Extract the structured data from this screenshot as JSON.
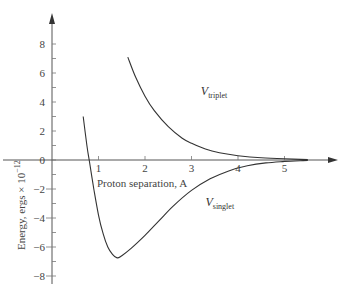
{
  "chart_data": {
    "type": "line",
    "title": "",
    "xlabel": "Proton separation, A",
    "ylabel": "Energy, ergs × 10^-12",
    "ylabel_parts": {
      "main": "Energy, ergs × 10",
      "exp": "−12"
    },
    "xlim": [
      0,
      6
    ],
    "ylim": [
      -8.5,
      9.5
    ],
    "x_ticks": [
      1,
      2,
      3,
      4,
      5
    ],
    "y_ticks": [
      8,
      6,
      4,
      2,
      0,
      -2,
      -4,
      -6,
      -8
    ],
    "y_tick_labels": [
      "8",
      "6",
      "4",
      "2",
      "0",
      "−2",
      "−4",
      "−6",
      "−8"
    ],
    "grid": false,
    "legend": "none (inline curve labels)",
    "series": [
      {
        "name": "V_triplet",
        "label_main": "V",
        "label_sub": "triplet",
        "x": [
          1.63,
          1.8,
          2.0,
          2.2,
          2.5,
          2.8,
          3.0,
          3.3,
          3.6,
          4.0,
          4.5,
          5.0,
          5.5
        ],
        "y": [
          7.1,
          5.7,
          4.4,
          3.4,
          2.3,
          1.5,
          1.15,
          0.75,
          0.5,
          0.3,
          0.15,
          0.08,
          0.03
        ]
      },
      {
        "name": "V_singlet",
        "label_main": "V",
        "label_sub": "singlet",
        "x": [
          0.67,
          0.75,
          0.8,
          0.9,
          1.0,
          1.1,
          1.2,
          1.3,
          1.4,
          1.5,
          1.7,
          2.0,
          2.3,
          2.6,
          3.0,
          3.4,
          3.8,
          4.2,
          4.6,
          5.0,
          5.5
        ],
        "y": [
          3.0,
          1.0,
          0.0,
          -2.0,
          -3.8,
          -5.1,
          -6.0,
          -6.5,
          -6.75,
          -6.6,
          -6.1,
          -5.2,
          -4.2,
          -3.2,
          -2.1,
          -1.3,
          -0.75,
          -0.4,
          -0.2,
          -0.1,
          -0.03
        ]
      }
    ],
    "annotations": [
      {
        "text": "V_triplet",
        "x": 3.2,
        "y": 4.5
      },
      {
        "text": "V_singlet",
        "x": 3.3,
        "y": -3.2
      }
    ]
  }
}
